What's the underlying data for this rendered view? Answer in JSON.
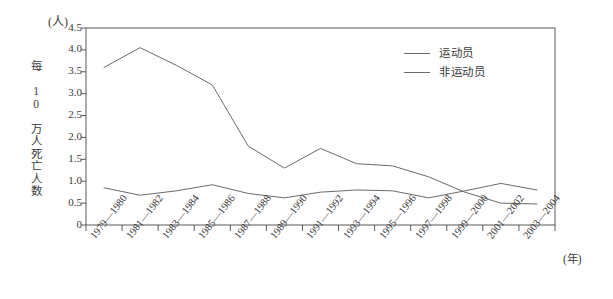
{
  "chart_data": {
    "type": "line",
    "title": "",
    "xlabel": "(年)",
    "ylabel": "每 10 万人死亡人数",
    "yunit": "(人)",
    "ylim": [
      0,
      4.5
    ],
    "yticks": [
      "0",
      "0.5",
      "1.0",
      "1.5",
      "2.0",
      "2.5",
      "3.0",
      "3.5",
      "4.0",
      "4.5"
    ],
    "ytick_values": [
      0,
      0.5,
      1.0,
      1.5,
      2.0,
      2.5,
      3.0,
      3.5,
      4.0,
      4.5
    ],
    "grid": false,
    "legend_position": "top-right",
    "categories": [
      "1979—1980",
      "1981—1982",
      "1983—1984",
      "1985—1986",
      "1987—1988",
      "1989—1990",
      "1991—1992",
      "1993—1994",
      "1995—1996",
      "1997—1998",
      "1999—2000",
      "2001—2002",
      "2003—2004"
    ],
    "series": [
      {
        "name": "运动员",
        "color": "#6b6b6b",
        "values": [
          3.6,
          4.05,
          3.65,
          3.2,
          1.8,
          1.3,
          1.75,
          1.4,
          1.35,
          1.1,
          0.75,
          0.5,
          0.48
        ]
      },
      {
        "name": "非运动员",
        "color": "#6b6b6b",
        "values": [
          0.85,
          0.68,
          0.78,
          0.92,
          0.72,
          0.62,
          0.75,
          0.8,
          0.78,
          0.62,
          0.78,
          0.95,
          0.8
        ]
      }
    ]
  },
  "legend": {
    "items": [
      {
        "label": "运动员"
      },
      {
        "label": "非运动员"
      }
    ]
  },
  "axes": {
    "y_unit_label": "(人)",
    "x_unit_label": "(年)",
    "y_axis_title": "每 10 万人死亡人数"
  }
}
